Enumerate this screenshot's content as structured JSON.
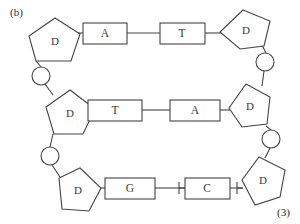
{
  "figure": {
    "panel_label": "(b)",
    "corner_label": "(3)",
    "ink_color": "#444444",
    "text_color": "#3a3a3a",
    "background_color": "#ffffff"
  },
  "sugars": [
    {
      "id": "sugar-top-left",
      "label": "D",
      "cx": 55,
      "cy": 41
    },
    {
      "id": "sugar-top-right",
      "label": "D",
      "cx": 245,
      "cy": 30
    },
    {
      "id": "sugar-middle-left",
      "label": "D",
      "cx": 70,
      "cy": 113
    },
    {
      "id": "sugar-middle-right",
      "label": "D",
      "cx": 249,
      "cy": 106
    },
    {
      "id": "sugar-bottom-left",
      "label": "D",
      "cx": 77,
      "cy": 190
    },
    {
      "id": "sugar-bottom-right",
      "label": "D",
      "cx": 263,
      "cy": 181
    }
  ],
  "phosphates": [
    {
      "id": "phosphate-left-upper",
      "cx": 41,
      "cy": 76
    },
    {
      "id": "phosphate-right-upper",
      "cx": 265,
      "cy": 62
    },
    {
      "id": "phosphate-left-lower",
      "cx": 50,
      "cy": 156
    },
    {
      "id": "phosphate-right-lower",
      "cx": 271,
      "cy": 139
    }
  ],
  "bases": [
    {
      "id": "base-a-top",
      "label": "A",
      "x": 83,
      "y": 23,
      "w": 44,
      "h": 21
    },
    {
      "id": "base-t-top",
      "label": "T",
      "x": 160,
      "y": 23,
      "w": 45,
      "h": 21
    },
    {
      "id": "base-t-middle",
      "label": "T",
      "x": 88,
      "y": 100,
      "w": 54,
      "h": 21
    },
    {
      "id": "base-a-middle",
      "label": "A",
      "x": 170,
      "y": 100,
      "w": 50,
      "h": 21
    },
    {
      "id": "base-g-bottom",
      "label": "G",
      "x": 105,
      "y": 178,
      "w": 50,
      "h": 21
    },
    {
      "id": "base-c-bottom",
      "label": "C",
      "x": 185,
      "y": 178,
      "w": 45,
      "h": 21
    }
  ],
  "pairs": [
    {
      "id": "pair-top",
      "left": "A",
      "right": "T"
    },
    {
      "id": "pair-middle",
      "left": "T",
      "right": "A"
    },
    {
      "id": "pair-bottom",
      "left": "G",
      "right": "C"
    }
  ]
}
